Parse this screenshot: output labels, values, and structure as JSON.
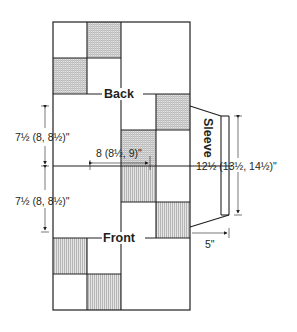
{
  "diagram": {
    "labels": {
      "back": "Back",
      "front": "Front",
      "sleeve": "Sleeve"
    },
    "measurements": {
      "back_length": "7½ (8, 8½)\"",
      "front_length": "7½ (8, 8½)\"",
      "half_width": "8 (8½, 9)\"",
      "sleeve_width": "12½ (13½, 14½)\"",
      "sleeve_length": "5\""
    },
    "colors": {
      "line": "#231f20",
      "shade": "#bdbdbd",
      "background": "#ffffff"
    },
    "blocks": {
      "back_shaded": [
        {
          "col": 1,
          "row": 0,
          "pattern": "grid"
        },
        {
          "col": 0,
          "row": 1,
          "pattern": "grid"
        },
        {
          "col": 3,
          "row": 2,
          "pattern": "grid"
        },
        {
          "col": 2,
          "row": 3,
          "pattern": "grid"
        }
      ],
      "front_shaded": [
        {
          "col": 2,
          "row": 4,
          "pattern": "stripes"
        },
        {
          "col": 3,
          "row": 5,
          "pattern": "stripes"
        },
        {
          "col": 0,
          "row": 6,
          "pattern": "stripes"
        },
        {
          "col": 1,
          "row": 7,
          "pattern": "stripes"
        }
      ]
    }
  }
}
